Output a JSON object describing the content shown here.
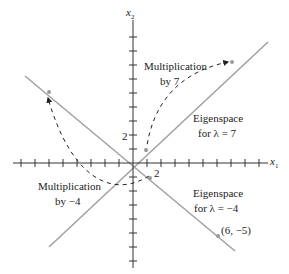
{
  "diagram": {
    "axes": {
      "x_label": "x",
      "x_sub": "1",
      "y_label": "x",
      "y_sub": "2",
      "x_tick_label": "2",
      "y_tick_label": "2"
    },
    "labels": {
      "mult7_line1": "Multiplication",
      "mult7_line2": "by 7",
      "mult4_line1": "Multiplication",
      "mult4_line2": "by −4",
      "eig7_line1": "Eigenspace",
      "eig7_line2": "for λ = 7",
      "eig4_line1": "Eigenspace",
      "eig4_line2": "for λ = −4",
      "point": "(6, −5)"
    },
    "colors": {
      "axis": "#333333",
      "eigenline": "#a0a0a0",
      "dashed": "#222222",
      "text": "#222222"
    }
  }
}
